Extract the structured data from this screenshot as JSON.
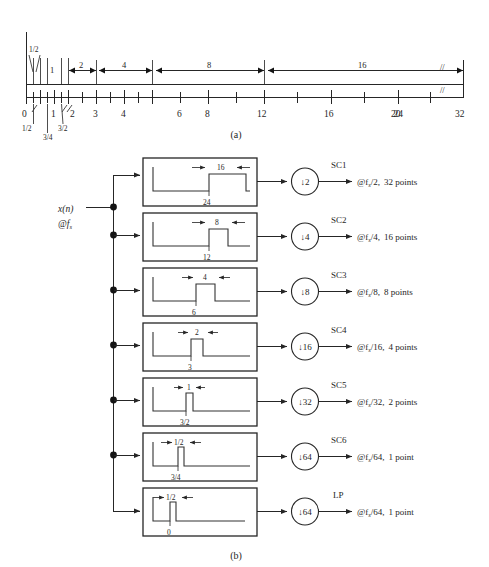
{
  "figure": {
    "panel_a_caption": "(a)",
    "panel_b_caption": "(b)"
  },
  "chart_data": {
    "type": "diagram",
    "panel_a": {
      "type": "number-line",
      "axis_min": 0,
      "axis_max": 32,
      "break_symbol": "//",
      "major_tick_labels": [
        "0",
        "1",
        "2",
        "3",
        "4",
        "6",
        "8",
        "12",
        "16",
        "20",
        "24",
        "32"
      ],
      "minor_fraction_labels": [
        "1/2",
        "3/4",
        "3/2"
      ],
      "top_fraction_label": "1/2",
      "span_labels": [
        "1/2",
        "1",
        "2",
        "4",
        "8",
        "16"
      ],
      "spans": [
        {
          "label": "1/2",
          "from": 0,
          "to": 0.5
        },
        {
          "label": "1",
          "from": 1,
          "to": 2
        },
        {
          "label": "2",
          "from": 2,
          "to": 4
        },
        {
          "label": "4",
          "from": 4,
          "to": 8
        },
        {
          "label": "8",
          "from": 8,
          "to": 16
        },
        {
          "label": "16",
          "from": 16,
          "to": 32
        }
      ]
    },
    "panel_b": {
      "type": "block-diagram",
      "input_signal": "x(n)",
      "input_rate": "@f",
      "input_rate_sub": "s",
      "rows": [
        {
          "band_top": "16",
          "band_bottom": "24",
          "decimator": "↓2",
          "output": "SC1",
          "rate": "@f",
          "rate_sub": "s",
          "rate_div": "/2,",
          "points": "32 points"
        },
        {
          "band_top": "8",
          "band_bottom": "12",
          "decimator": "↓4",
          "output": "SC2",
          "rate": "@f",
          "rate_sub": "s",
          "rate_div": "/4,",
          "points": "16 points"
        },
        {
          "band_top": "4",
          "band_bottom": "6",
          "decimator": "↓8",
          "output": "SC3",
          "rate": "@f",
          "rate_sub": "s",
          "rate_div": "/8,",
          "points": "8 points"
        },
        {
          "band_top": "2",
          "band_bottom": "3",
          "decimator": "↓16",
          "output": "SC4",
          "rate": "@f",
          "rate_sub": "s",
          "rate_div": "/16,",
          "points": "4 points"
        },
        {
          "band_top": "1",
          "band_bottom": "3/2",
          "decimator": "↓32",
          "output": "SC5",
          "rate": "@f",
          "rate_sub": "s",
          "rate_div": "/32,",
          "points": "2 points"
        },
        {
          "band_top": "1/2",
          "band_bottom": "3/4",
          "decimator": "↓64",
          "output": "SC6",
          "rate": "@f",
          "rate_sub": "s",
          "rate_div": "/64,",
          "points": "1 point"
        },
        {
          "band_top": "1/2",
          "band_bottom": "0",
          "decimator": "↓64",
          "output": "LP",
          "rate": "@f",
          "rate_sub": "s",
          "rate_div": "/64,",
          "points": "1 point"
        }
      ]
    }
  },
  "colors": {
    "ink": "#262626",
    "background": "#ffffff"
  }
}
